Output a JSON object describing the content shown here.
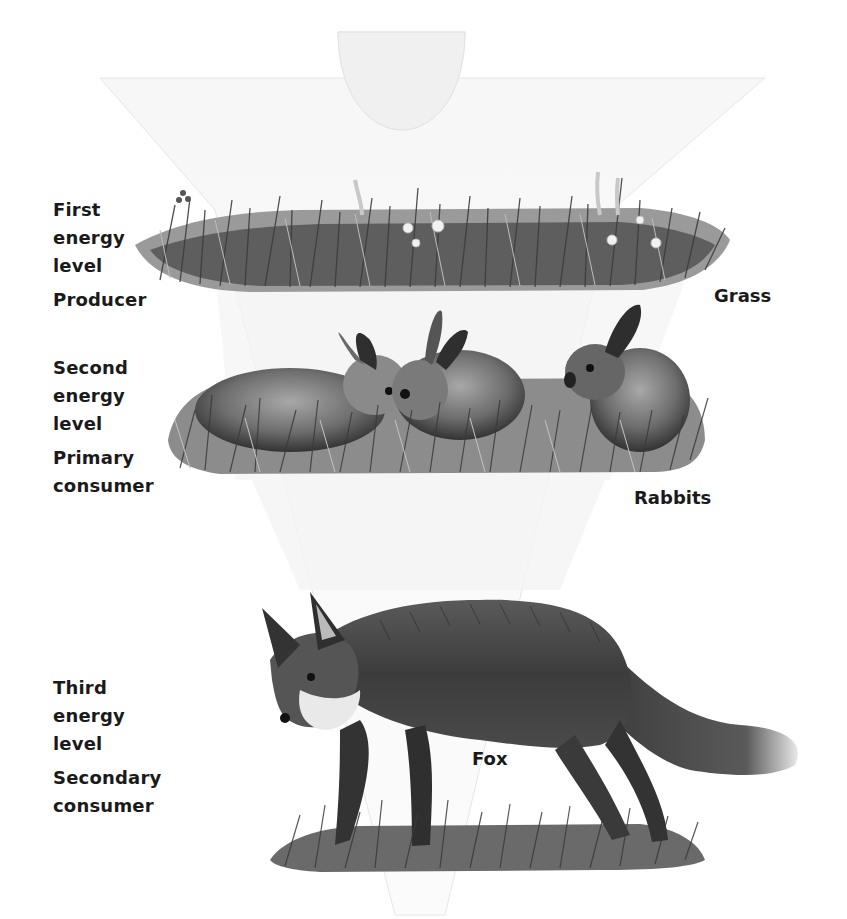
{
  "diagram": {
    "type": "energy-pyramid (inverted food chain)",
    "levels": [
      {
        "level_lines": [
          "First",
          "energy",
          "level"
        ],
        "role": "Producer",
        "organism": "Grass"
      },
      {
        "level_lines": [
          "Second",
          "energy",
          "level"
        ],
        "role_lines": [
          "Primary",
          "consumer"
        ],
        "organism": "Rabbits"
      },
      {
        "level_lines": [
          "Third",
          "energy",
          "level"
        ],
        "role_lines": [
          "Secondary",
          "consumer"
        ],
        "organism": "Fox"
      }
    ]
  },
  "colors": {
    "background": "#ffffff",
    "text": "#1a1a1a",
    "sun_fill": "#f1f1f1",
    "pyramid_fill": "#f5f5f5",
    "grass_dark": "#3a3a3a",
    "grass_mid": "#777777",
    "fur_dark": "#2e2e2e",
    "fur_mid": "#6a6a6a",
    "fur_light": "#bdbdbd"
  }
}
